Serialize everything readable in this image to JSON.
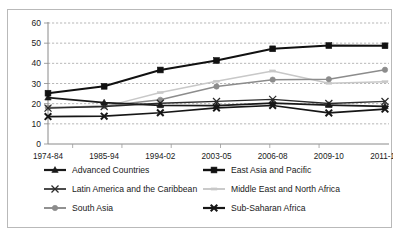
{
  "chart_data": {
    "type": "line",
    "title": "",
    "xlabel": "",
    "ylabel": "",
    "ylim": [
      0,
      60
    ],
    "ytick_step": 10,
    "grid": true,
    "legend_position": "bottom",
    "categories": [
      "1974-84",
      "1985-94",
      "1994-02",
      "2003-05",
      "2006-08",
      "2009-10",
      "2011-15"
    ],
    "yticks": [
      "0",
      "10",
      "20",
      "30",
      "40",
      "50",
      "60"
    ],
    "series": [
      {
        "name": "Advanced Countries",
        "marker": "triangle",
        "color": "#1a1a1a",
        "values": [
          23.0,
          20.5,
          19.2,
          19.0,
          20.3,
          19.3,
          18.7
        ]
      },
      {
        "name": "East Asia and Pacific",
        "marker": "square",
        "color": "#111111",
        "values": [
          25.2,
          28.6,
          36.7,
          41.4,
          47.2,
          48.8,
          48.7
        ]
      },
      {
        "name": "Latin America and the Caribbean",
        "marker": "x",
        "color": "#2b2b2b",
        "values": [
          17.8,
          18.6,
          20.2,
          21.1,
          22.1,
          20.1,
          21.1
        ]
      },
      {
        "name": "Middle East and North Africa",
        "marker": "dash",
        "color": "#c8c8c8",
        "values": [
          18.1,
          18.4,
          25.5,
          31.1,
          36.2,
          30.1,
          30.9
        ]
      },
      {
        "name": "South Asia",
        "marker": "circle",
        "color": "#8c8c8c",
        "values": [
          18.0,
          18.8,
          21.9,
          28.5,
          31.9,
          32.1,
          36.8
        ]
      },
      {
        "name": "Sub-Saharan Africa",
        "marker": "bold-x",
        "color": "#161616",
        "values": [
          13.6,
          13.8,
          15.5,
          17.9,
          19.1,
          15.4,
          17.3
        ]
      }
    ]
  }
}
